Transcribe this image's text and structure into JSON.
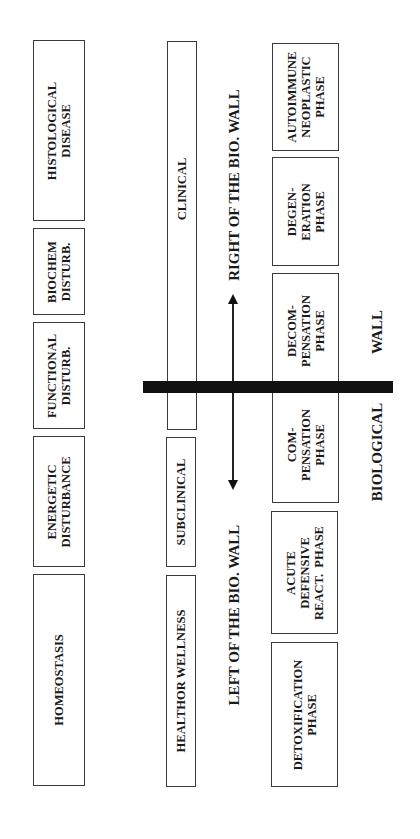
{
  "diagram": {
    "row1": [
      {
        "id": "homeostasis",
        "label": "HOMEOSTASIS"
      },
      {
        "id": "energetic",
        "label": "ENERGETIC\nDISTURBANCE"
      },
      {
        "id": "functional",
        "label": "FUNCTIONAL\nDISTURB."
      },
      {
        "id": "biochem",
        "label": "BIOCHEM\nDISTURB."
      },
      {
        "id": "histological",
        "label": "HISTOLOGICAL\nDISEASE"
      }
    ],
    "row2": [
      {
        "id": "health",
        "label": "HEALTHOR WELLNESS"
      },
      {
        "id": "subclinical",
        "label": "SUBCLINICAL"
      },
      {
        "id": "clinical",
        "label": "CLINICAL"
      }
    ],
    "arrows": {
      "left_label": "LEFT OF THE BIO. WALL",
      "right_label": "RIGHT OF THE BIO. WALL"
    },
    "row3": [
      {
        "id": "detox",
        "label": "DETOXIFICATION\nPHASE"
      },
      {
        "id": "acute",
        "label": "ACUTE\nDEFENSIVE\nREACT.  PHASE"
      },
      {
        "id": "compensation",
        "label": "COM-\nPENSATION\nPHASE"
      },
      {
        "id": "decompensation",
        "label": "DECOM-\nPENSATION\nPHASE"
      },
      {
        "id": "degeneration",
        "label": "DEGEN-\nERATION\nPHASE"
      },
      {
        "id": "autoimmune",
        "label": "AUTOIMMUNE\nNEOPLASTIC\nPHASE"
      }
    ],
    "wall_label": {
      "part1": "BIOLOGICAL",
      "part2": "WALL"
    }
  }
}
